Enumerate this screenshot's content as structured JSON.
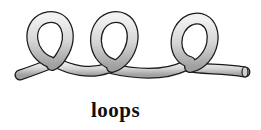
{
  "illustration": {
    "subject": "rope-with-loops",
    "loop_count": 3,
    "colors": {
      "rope_fill": "#d9d9d9",
      "rope_highlight": "#f2f2f2",
      "rope_shadow": "#9a9a9a",
      "outline": "#1a1a1a"
    }
  },
  "caption": {
    "text": "loops"
  }
}
